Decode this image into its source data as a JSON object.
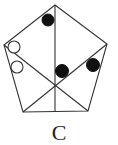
{
  "diagram": {
    "label": "C",
    "shape": "pentagon",
    "stroke_color": "#333333",
    "fill_color": "#111111",
    "vertices": [
      [
        55,
        5
      ],
      [
        107,
        44
      ],
      [
        88,
        111
      ],
      [
        23,
        112
      ],
      [
        4,
        45
      ]
    ],
    "center": [
      55,
      86
    ],
    "circles": [
      {
        "cx": 48,
        "cy": 20,
        "r": 6,
        "filled": true
      },
      {
        "cx": 14,
        "cy": 47,
        "r": 6,
        "filled": false
      },
      {
        "cx": 17,
        "cy": 67,
        "r": 6,
        "filled": false
      },
      {
        "cx": 62,
        "cy": 71,
        "r": 6.5,
        "filled": true
      },
      {
        "cx": 93,
        "cy": 65,
        "r": 6.5,
        "filled": true
      }
    ]
  }
}
